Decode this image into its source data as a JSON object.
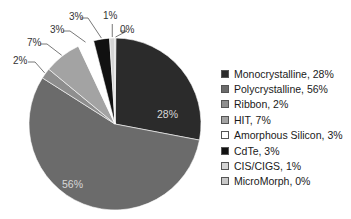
{
  "chart_data": {
    "type": "pie",
    "title": "",
    "categories": [
      "Monocrystalline",
      "Polycrystalline",
      "Ribbon",
      "HIT",
      "Amorphous Silicon",
      "CdTe",
      "CIS/CIGS",
      "MicroMorph"
    ],
    "values": [
      28,
      56,
      2,
      7,
      3,
      3,
      1,
      0
    ],
    "value_labels": [
      "28%",
      "56%",
      "2%",
      "7%",
      "3%",
      "3%",
      "1%",
      "0%"
    ],
    "colors": [
      "#2b2b2b",
      "#6b6b6b",
      "#8e8e8e",
      "#a3a3a3",
      "#ffffff",
      "#111111",
      "#d4d4d4",
      "#c8c8c8"
    ],
    "start_angle": "12 o'clock",
    "direction": "clockwise",
    "legend_position": "right",
    "legend": [
      "Monocrystalline, 28%",
      "Polycrystalline, 56%",
      "Ribbon, 2%",
      "HIT, 7%",
      "Amorphous Silicon, 3%",
      "CdTe, 3%",
      "CIS/CIGS, 1%",
      "MicroMorph, 0%"
    ]
  }
}
